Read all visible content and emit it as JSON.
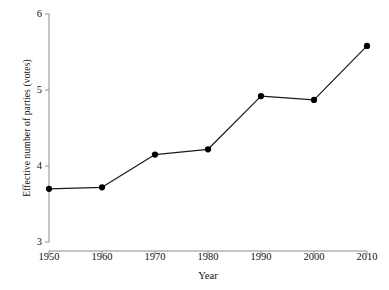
{
  "chart_data": {
    "type": "line",
    "title": "",
    "subtitle": "",
    "xlabel": "Year",
    "ylabel": "Effective number of parties (votes)",
    "x": [
      1950,
      1960,
      1970,
      1980,
      1990,
      2000,
      2010
    ],
    "categories": [
      "1950",
      "1960",
      "1970",
      "1980",
      "1990",
      "2000",
      "2010"
    ],
    "values": [
      3.7,
      3.72,
      4.15,
      4.22,
      4.92,
      4.87,
      5.58
    ],
    "series": [
      {
        "name": "Effective number of parties (votes)",
        "values": [
          3.7,
          3.72,
          4.15,
          4.22,
          4.92,
          4.87,
          5.58
        ]
      }
    ],
    "xlim": [
      1950,
      2010
    ],
    "ylim": [
      3,
      6
    ],
    "xticks": [
      1950,
      1960,
      1970,
      1980,
      1990,
      2000,
      2010
    ],
    "yticks": [
      3,
      4,
      5,
      6
    ],
    "xtick_labels": [
      "1950",
      "1960",
      "1970",
      "1980",
      "1990",
      "2000",
      "2010"
    ],
    "ytick_labels": [
      "3",
      "4",
      "5",
      "6"
    ],
    "grid": false,
    "legend": false,
    "legend_position": "none",
    "annotations": [],
    "style": {
      "line_color": "#1a1a1a",
      "marker_color": "#000000",
      "marker_shape": "circle",
      "marker_size": 5,
      "line_width": 1.2,
      "axis_color": "#8c8c8c",
      "background": "#ffffff",
      "tick_direction": "out"
    }
  }
}
